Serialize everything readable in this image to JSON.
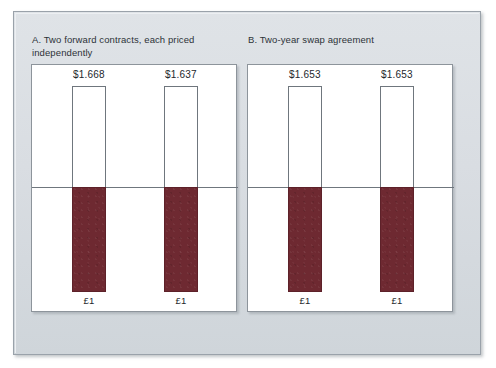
{
  "figure": {
    "background_color": "#ffffff",
    "plate_color": "#d9dde2",
    "accent_fill_color": "#6e2931",
    "outline_color": "#6f767d"
  },
  "panels": [
    {
      "id": "panel-a",
      "title": "A. Two forward contracts, each priced independently",
      "bars": [
        {
          "top_label": "$1.668",
          "bottom_label": "£1"
        },
        {
          "top_label": "$1.637",
          "bottom_label": "£1"
        }
      ]
    },
    {
      "id": "panel-b",
      "title": "B. Two-year swap agreement",
      "bars": [
        {
          "top_label": "$1.653",
          "bottom_label": "£1"
        },
        {
          "top_label": "$1.653",
          "bottom_label": "£1"
        }
      ]
    }
  ],
  "chart_data": {
    "type": "bar",
    "xlabel": "",
    "ylabel": "",
    "grid": false,
    "legend": "none",
    "axis_note": "Each bar is split by a horizontal zero line: the hollow upper segment is the dollar amount received, the filled lower segment is the £1 paid.",
    "panels": [
      {
        "name": "A. Two forward contracts, each priced independently",
        "categories": [
          "Year 1 forward",
          "Year 2 forward"
        ],
        "series": [
          {
            "name": "Dollars received (upper, hollow)",
            "values": [
              1.668,
              1.637
            ],
            "value_labels": [
              "$1.668",
              "$1.637"
            ]
          },
          {
            "name": "Pounds paid (lower, filled)",
            "values": [
              1,
              1
            ],
            "value_labels": [
              "£1",
              "£1"
            ]
          }
        ]
      },
      {
        "name": "B. Two-year swap agreement",
        "categories": [
          "Year 1 swap leg",
          "Year 2 swap leg"
        ],
        "series": [
          {
            "name": "Dollars received (upper, hollow)",
            "values": [
              1.653,
              1.653
            ],
            "value_labels": [
              "$1.653",
              "$1.653"
            ]
          },
          {
            "name": "Pounds paid (lower, filled)",
            "values": [
              1,
              1
            ],
            "value_labels": [
              "£1",
              "£1"
            ]
          }
        ]
      }
    ]
  }
}
